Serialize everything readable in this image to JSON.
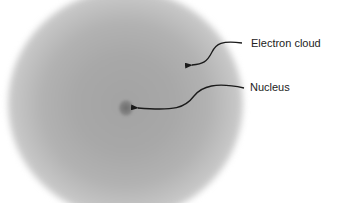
{
  "diagram": {
    "labels": {
      "electron_cloud": "Electron cloud",
      "nucleus": "Nucleus"
    },
    "colors": {
      "background": "#ffffff",
      "cloud": "#a8a8a8",
      "nucleus": "#6e6e6e",
      "arrow": "#1a1a1a",
      "text": "#222222"
    }
  }
}
